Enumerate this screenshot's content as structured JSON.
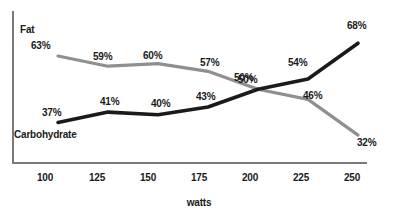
{
  "chart_data": {
    "type": "line",
    "title": "",
    "xlabel": "watts",
    "ylabel": "",
    "categories": [
      100,
      125,
      150,
      175,
      200,
      225,
      250
    ],
    "x_tick_labels": [
      "100",
      "125",
      "150",
      "175",
      "200",
      "225",
      "250"
    ],
    "xlim": [
      100,
      250
    ],
    "ylim": [
      25,
      72
    ],
    "grid": false,
    "legend_position": "inline-labels",
    "series": [
      {
        "name": "Fat",
        "color": "#8f8f8f",
        "values": [
          63,
          59,
          60,
          57,
          50,
          46,
          32
        ],
        "point_labels": [
          "63%",
          "59%",
          "60%",
          "57%",
          "50%",
          "46%",
          "32%"
        ]
      },
      {
        "name": "Carbohydrate",
        "color": "#1a1a1a",
        "values": [
          37,
          41,
          40,
          43,
          50,
          54,
          68
        ],
        "point_labels": [
          "37%",
          "41%",
          "40%",
          "43%",
          "50%",
          "54%",
          "68%"
        ]
      }
    ]
  },
  "labels": {
    "fat_series_label": "Fat",
    "carb_series_label": "Carbohydrate",
    "x_axis_title": "watts"
  },
  "colors": {
    "fat_line": "#8f8f8f",
    "carb_line": "#1a1a1a",
    "axis": "#7a7a7a",
    "text": "#1a1a1a",
    "background": "#ffffff"
  }
}
